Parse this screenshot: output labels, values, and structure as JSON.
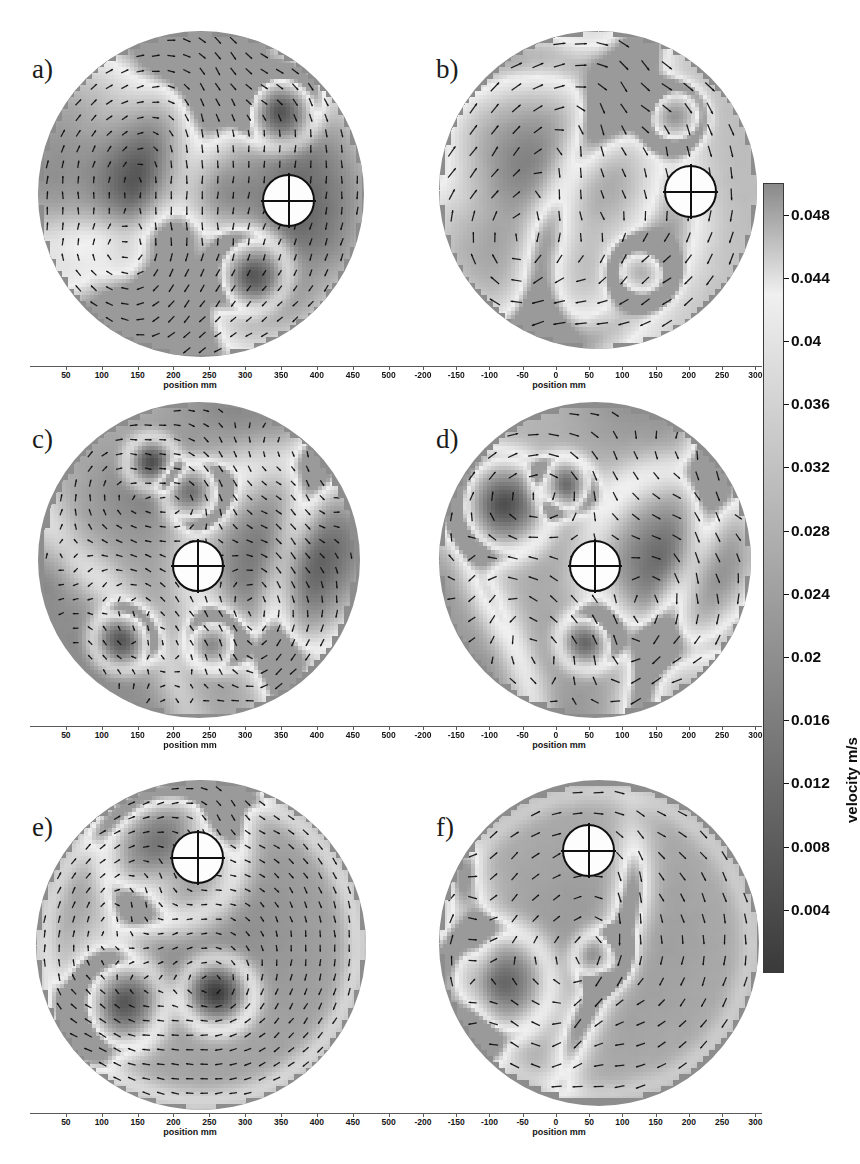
{
  "figure": {
    "kind": "piv-velocity-field-panels",
    "panel_count": 6,
    "background_color": "#ffffff"
  },
  "chart_data": {
    "type": "heatmap",
    "title": "",
    "subtitle": "",
    "xlabel": "position mm",
    "ylabel": "",
    "colorbar": {
      "label": "velocity m/s",
      "ticks": [
        0.004,
        0.008,
        0.012,
        0.016,
        0.02,
        0.024,
        0.028,
        0.032,
        0.036,
        0.04,
        0.044,
        0.048
      ],
      "tick_labels": [
        "0.004",
        "0.008",
        "0.012",
        "0.016",
        "0.02",
        "0.024",
        "0.028",
        "0.032",
        "0.036",
        "0.04",
        "0.044",
        "0.048"
      ],
      "range": [
        0.0,
        0.05
      ],
      "orientation": "vertical",
      "position": "right",
      "colormap": "grayscale",
      "low_color": "#3a3a3a",
      "high_color": "#f2f2f2"
    },
    "axes": [
      {
        "id": "left-column",
        "xlim": [
          0,
          520
        ],
        "ticks": [
          50,
          100,
          150,
          200,
          250,
          300,
          350,
          400,
          450,
          500
        ],
        "tick_labels": [
          "50",
          "100",
          "150",
          "200",
          "250",
          "300",
          "350",
          "400",
          "450",
          "500"
        ],
        "xlabel": "position mm",
        "grid": false
      },
      {
        "id": "right-column",
        "xlim": [
          -230,
          310
        ],
        "ticks": [
          -200,
          -150,
          -100,
          -50,
          0,
          50,
          100,
          150,
          200,
          250,
          300
        ],
        "tick_labels": [
          "-200",
          "-150",
          "-100",
          "-50",
          "0",
          "50",
          "100",
          "150",
          "200",
          "250",
          "300"
        ],
        "xlabel": "position mm",
        "grid": false
      }
    ],
    "panels": [
      {
        "label": "a)",
        "column": "left",
        "row": 1,
        "axis_id": "left-column",
        "probe": {
          "x_frac": 0.78,
          "y_frac": 0.52
        },
        "mean_velocity": 0.021,
        "arrow_grid": "fine",
        "features": [
          "vertical high-velocity jet band",
          "upper-right vortex",
          "lower-right vortex"
        ]
      },
      {
        "label": "b)",
        "column": "right",
        "row": 1,
        "axis_id": "right-column",
        "probe": {
          "x_frac": 0.79,
          "y_frac": 0.5
        },
        "mean_velocity": 0.026,
        "arrow_grid": "coarse",
        "features": [
          "diagonal high-velocity filament",
          "upper-right vortex core",
          "lower-right vortex core"
        ]
      },
      {
        "label": "c)",
        "column": "left",
        "row": 2,
        "axis_id": "left-column",
        "probe": {
          "x_frac": 0.5,
          "y_frac": 0.52
        },
        "mean_velocity": 0.024,
        "arrow_grid": "fine",
        "features": [
          "central stagnation point",
          "four quadrant vortices",
          "right-side high-velocity arc"
        ]
      },
      {
        "label": "d)",
        "column": "right",
        "row": 2,
        "axis_id": "right-column",
        "probe": {
          "x_frac": 0.5,
          "y_frac": 0.52
        },
        "mean_velocity": 0.023,
        "arrow_grid": "coarse",
        "features": [
          "central stagnation point",
          "upper-left vortex",
          "lower-centre vortex",
          "right-side shear band"
        ]
      },
      {
        "label": "e)",
        "column": "left",
        "row": 3,
        "axis_id": "left-column",
        "probe": {
          "x_frac": 0.49,
          "y_frac": 0.21
        },
        "mean_velocity": 0.027,
        "arrow_grid": "fine",
        "features": [
          "large left recirculation cell",
          "central vortex core",
          "peripheral high-velocity rim"
        ]
      },
      {
        "label": "f)",
        "column": "right",
        "row": 3,
        "axis_id": "right-column",
        "probe": {
          "x_frac": 0.47,
          "y_frac": 0.2
        },
        "mean_velocity": 0.022,
        "arrow_grid": "coarse",
        "features": [
          "central elongated high-velocity streak",
          "left boundary shear layer"
        ]
      }
    ]
  }
}
